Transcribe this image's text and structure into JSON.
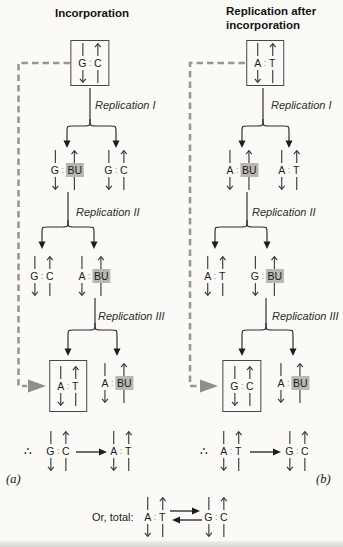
{
  "colors": {
    "background": "#fbfaf7",
    "ink": "#1d1d1d",
    "highlight_gray": "#b8b7b4",
    "dashed_gray": "#999792"
  },
  "colon": ":",
  "panel_a": {
    "title": "Incorporation",
    "panel_label": "(a)",
    "replication_labels": [
      "Replication I",
      "Replication II",
      "Replication III"
    ],
    "root_pair": {
      "left": "G",
      "right": "C"
    },
    "level1": [
      {
        "left": "G",
        "right": "BU"
      },
      {
        "left": "G",
        "right": "C"
      }
    ],
    "level2": [
      {
        "left": "G",
        "right": "C"
      },
      {
        "left": "A",
        "right": "BU"
      }
    ],
    "level3": [
      {
        "left": "A",
        "right": "T"
      },
      {
        "left": "A",
        "right": "BU"
      }
    ],
    "conclusion": {
      "therefore_symbol": "∴",
      "from": {
        "left": "G",
        "right": "C"
      },
      "to": {
        "left": "A",
        "right": "T"
      }
    }
  },
  "panel_b": {
    "title": "Replication after incorporation",
    "panel_label": "(b)",
    "replication_labels": [
      "Replication I",
      "Replication II",
      "Replication III"
    ],
    "root_pair": {
      "left": "A",
      "right": "T"
    },
    "level1": [
      {
        "left": "A",
        "right": "BU"
      },
      {
        "left": "A",
        "right": "T"
      }
    ],
    "level2": [
      {
        "left": "A",
        "right": "T"
      },
      {
        "left": "G",
        "right": "BU"
      }
    ],
    "level3": [
      {
        "left": "G",
        "right": "C"
      },
      {
        "left": "A",
        "right": "BU"
      }
    ],
    "conclusion": {
      "therefore_symbol": "∴",
      "from": {
        "left": "A",
        "right": "T"
      },
      "to": {
        "left": "G",
        "right": "C"
      }
    }
  },
  "total_line": {
    "label": "Or, total:",
    "left_pair": {
      "left": "A",
      "right": "T"
    },
    "right_pair": {
      "left": "G",
      "right": "C"
    }
  }
}
